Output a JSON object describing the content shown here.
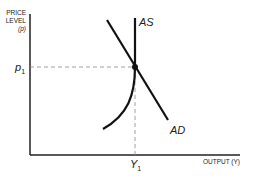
{
  "diagram": {
    "type": "economics-supply-demand",
    "y_axis_label_lines": [
      "PRICE",
      "LEVEL",
      "(p)"
    ],
    "x_axis_label": "OUTPUT (Y)",
    "price_label": "p",
    "price_subscript": "1",
    "output_label": "Y",
    "output_subscript": "1",
    "curves": [
      {
        "name": "AS",
        "label": "AS"
      },
      {
        "name": "AD",
        "label": "AD"
      }
    ],
    "colors": {
      "line": "#111111",
      "axis": "#222222",
      "dash": "#888888"
    }
  }
}
